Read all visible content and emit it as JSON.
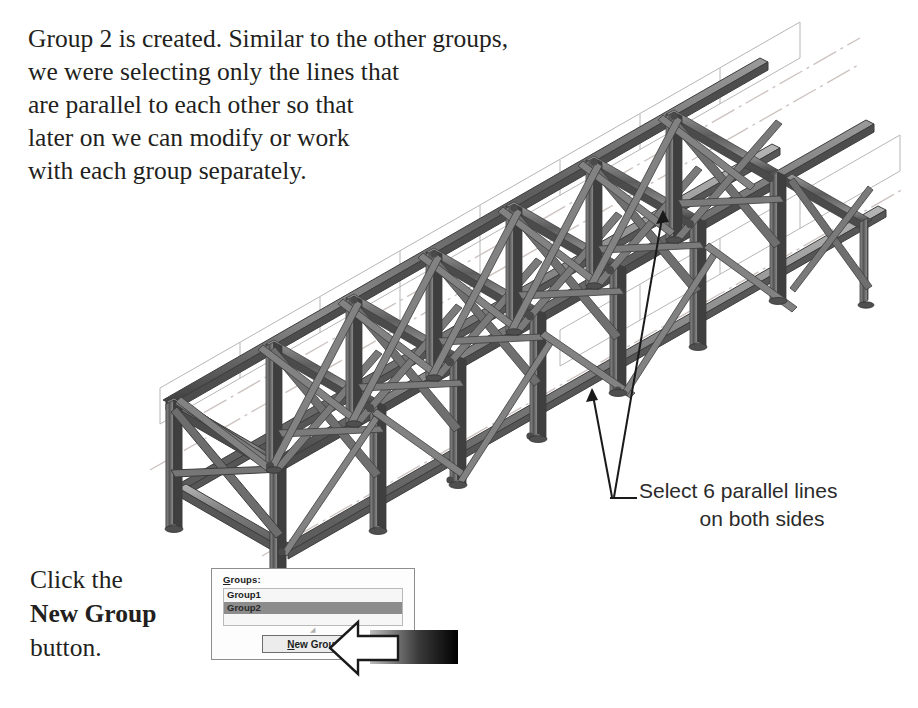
{
  "page": {
    "width": 918,
    "height": 708,
    "background": "#ffffff"
  },
  "intro": {
    "paragraph": "Group 2 is created. Similar to the other groups,\nwe were selecting only the lines that\nare parallel to each other so that\nlater on we can modify or work\nwith each group separately."
  },
  "click_instruction": {
    "line1": "Click the",
    "line2": "New Group",
    "line3": "button."
  },
  "callout": {
    "line1": "Select 6 parallel lines",
    "line2": "on both sides"
  },
  "dialog": {
    "groups_label_mnemonic": "G",
    "groups_label_rest": "roups:",
    "list_items": [
      {
        "label": "Group1",
        "selected": false
      },
      {
        "label": "Group2",
        "selected": true
      },
      {
        "label": "",
        "selected": false
      }
    ],
    "resize_glyph": "◢",
    "button": {
      "mnemonic": "N",
      "rest": "ew Group"
    }
  },
  "figure": {
    "type": "isometric-truss-frame",
    "bay_count": 6,
    "colors": {
      "beam_dark": "#4a4a4a",
      "beam_mid": "#7a7a7a",
      "beam_light": "#a8a8a8",
      "guide_line": "#b4b4b4",
      "center_line": "#c9c0bd",
      "outline": "#2f2f2f",
      "text": "#231f20",
      "callout_text": "#2b2b2b",
      "selection": "#8c8c8c",
      "gradient_dark": "#000000",
      "gradient_light": "#bdbdbd"
    }
  }
}
